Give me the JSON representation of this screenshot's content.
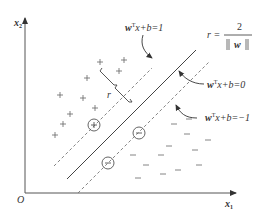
{
  "axes": {
    "x_label": "x",
    "x_sub": "1",
    "y_label": "x",
    "y_sub": "2",
    "origin": "O"
  },
  "labels": {
    "upper_margin": {
      "w": "w",
      "sup": "T",
      "rest": "x+b=1"
    },
    "hyperplane": {
      "w": "w",
      "sup": "T",
      "rest": "x+b=0"
    },
    "lower_margin": {
      "w": "w",
      "sup": "T",
      "rest": "x+b=−1"
    },
    "margin_r": "r",
    "formula": {
      "lhs": "r =",
      "numerator": "2",
      "denominator_w": "w"
    }
  },
  "points": {
    "positive_symbol": "+",
    "negative_symbol": "−",
    "positive": [
      [
        100,
        62
      ],
      [
        124,
        60
      ],
      [
        87,
        78
      ],
      [
        119,
        71
      ],
      [
        60,
        95
      ],
      [
        83,
        98
      ],
      [
        95,
        108
      ],
      [
        70,
        115
      ],
      [
        55,
        135
      ],
      [
        60,
        124
      ]
    ],
    "negative": [
      [
        175,
        125
      ],
      [
        188,
        135
      ],
      [
        172,
        145
      ],
      [
        160,
        155
      ],
      [
        195,
        150
      ],
      [
        145,
        165
      ],
      [
        160,
        173
      ],
      [
        132,
        178
      ],
      [
        175,
        172
      ],
      [
        150,
        140
      ],
      [
        196,
        118
      ]
    ],
    "support_positive": [
      [
        95,
        126
      ]
    ],
    "support_negative": [
      [
        148,
        140
      ],
      [
        108,
        187
      ]
    ]
  },
  "colors": {
    "axis": "#555555",
    "line": "#444444",
    "dashed": "#777777",
    "text": "#333333"
  }
}
